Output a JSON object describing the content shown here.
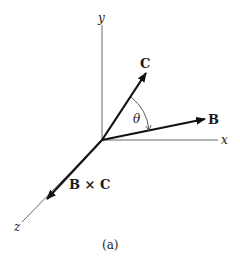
{
  "figure": {
    "caption": "(a)",
    "axes": {
      "x_label": "x",
      "y_label": "y",
      "z_label": "z"
    },
    "vectors": [
      {
        "name": "B",
        "label": "B"
      },
      {
        "name": "C",
        "label": "C"
      },
      {
        "name": "BxC",
        "label": "B × C"
      }
    ],
    "angle_label": "θ",
    "colors": {
      "axis": "#555555",
      "vector": "#111111",
      "background": "#ffffff"
    }
  }
}
